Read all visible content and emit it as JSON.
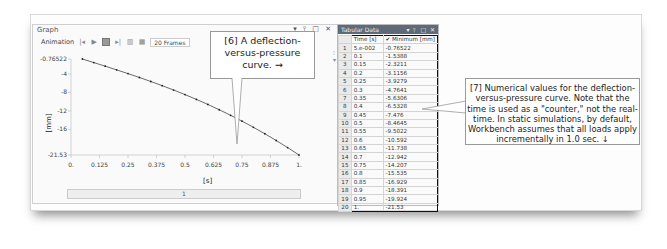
{
  "graph": {
    "title": "Graph",
    "window_buttons": "▾ ⫯ □ ✕",
    "toolbar": {
      "animation_label": "Animation",
      "icons": [
        "rewind-icon",
        "play-icon",
        "stop-icon",
        "step-forward-icon",
        "distribute-frames-icon",
        "result-frames-icon"
      ],
      "frames_label": "20 Frames"
    },
    "y_axis_title": "[mm]",
    "x_axis_title": "[s]",
    "slider_value": "1"
  },
  "callout6": {
    "text": "[6] A deflection-versus-pressure curve. →"
  },
  "tabular": {
    "title": "Tabular Data",
    "window_buttons": "▾ ⫯ □ ✕",
    "columns": [
      "Time [s]",
      "✔ Minimum [mm]"
    ],
    "rows": [
      [
        "1",
        "5.e-002",
        "-0.76522"
      ],
      [
        "2",
        "0.1",
        "-1.5388"
      ],
      [
        "3",
        "0.15",
        "-2.3211"
      ],
      [
        "4",
        "0.2",
        "-3.1156"
      ],
      [
        "5",
        "0.25",
        "-3.9279"
      ],
      [
        "6",
        "0.3",
        "-4.7641"
      ],
      [
        "7",
        "0.35",
        "-5.6306"
      ],
      [
        "8",
        "0.4",
        "-6.5328"
      ],
      [
        "9",
        "0.45",
        "-7.476"
      ],
      [
        "10",
        "0.5",
        "-8.4645"
      ],
      [
        "11",
        "0.55",
        "-9.5022"
      ],
      [
        "12",
        "0.6",
        "-10.592"
      ],
      [
        "13",
        "0.65",
        "-11.738"
      ],
      [
        "14",
        "0.7",
        "-12.942"
      ],
      [
        "15",
        "0.75",
        "-14.207"
      ],
      [
        "16",
        "0.8",
        "-15.535"
      ],
      [
        "17",
        "0.85",
        "-16.929"
      ],
      [
        "18",
        "0.9",
        "-18.391"
      ],
      [
        "19",
        "0.95",
        "-19.924"
      ],
      [
        "20",
        "1.",
        "-21.53"
      ]
    ]
  },
  "callout7": {
    "text": "[7] Numerical values for the deflection-versus-pressure curve.  Note that the time is used as a \"counter,\" not the real-time.  In static simulations, by default, Workbench assumes that all loads apply incrementally in 1.0 sec. ↓"
  },
  "chart_data": {
    "type": "line",
    "title": "",
    "xlabel": "[s]",
    "ylabel": "[mm]",
    "x": [
      0.05,
      0.1,
      0.15,
      0.2,
      0.25,
      0.3,
      0.35,
      0.4,
      0.45,
      0.5,
      0.55,
      0.6,
      0.65,
      0.7,
      0.75,
      0.8,
      0.85,
      0.9,
      0.95,
      1.0
    ],
    "series": [
      {
        "name": "Minimum [mm]",
        "values": [
          -0.76522,
          -1.5388,
          -2.3211,
          -3.1156,
          -3.9279,
          -4.7641,
          -5.6306,
          -6.5328,
          -7.476,
          -8.4645,
          -9.5022,
          -10.592,
          -11.738,
          -12.942,
          -14.207,
          -15.535,
          -16.929,
          -18.391,
          -19.924,
          -21.53
        ]
      }
    ],
    "x_ticks": [
      "0.",
      "0.125",
      "0.25",
      "0.375",
      "0.5",
      "0.625",
      "0.75",
      "0.875",
      "1."
    ],
    "y_ticks": [
      "-0.76522",
      "-4",
      "-8",
      "-12",
      "-16",
      "-21.53"
    ],
    "xlim": [
      0,
      1
    ],
    "ylim": [
      -21.53,
      -0.76522
    ],
    "grid": false,
    "legend": "none"
  }
}
